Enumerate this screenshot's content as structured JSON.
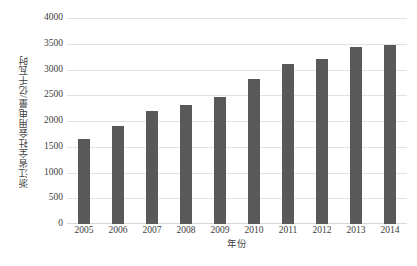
{
  "chart_data": {
    "type": "bar",
    "title": "",
    "subtitle": "",
    "xlabel": "年份",
    "ylabel": "浙江省全社会用电量/亿千瓦时",
    "categories": [
      "2005",
      "2006",
      "2007",
      "2008",
      "2009",
      "2010",
      "2011",
      "2012",
      "2013",
      "2014"
    ],
    "values": [
      1650,
      1905,
      2185,
      2315,
      2470,
      2815,
      3115,
      3205,
      3440,
      3475
    ],
    "series": [
      {
        "name": "浙江省全社会用电量",
        "values": [
          1650,
          1905,
          2185,
          2315,
          2470,
          2815,
          3115,
          3205,
          3440,
          3475
        ]
      }
    ],
    "ylim": [
      0,
      4000
    ],
    "ytick_values": [
      0,
      500,
      1000,
      1500,
      2000,
      2500,
      3000,
      3500,
      4000
    ],
    "ytick_labels": [
      "0",
      "500",
      "1000",
      "1500",
      "2000",
      "2500",
      "3000",
      "3500",
      "4000"
    ],
    "xtick_labels": [
      "2005",
      "2006",
      "2007",
      "2008",
      "2009",
      "2010",
      "2011",
      "2012",
      "2013",
      "2014"
    ],
    "grid": "horizontal",
    "legend": "none",
    "annotations": [],
    "colors": {
      "bar": "#595959",
      "gridline": "#e2e2e2",
      "baseline": "#d8d8d8",
      "text": "#404040",
      "background": "#ffffff"
    }
  }
}
